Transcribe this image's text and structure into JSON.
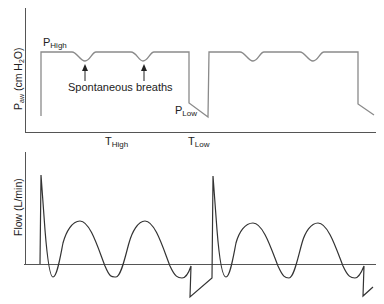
{
  "pressure_panel": {
    "ylabel_main": "P",
    "ylabel_sub": "aw",
    "ylabel_unit_prefix": " (cm H",
    "ylabel_unit_sub": "2",
    "ylabel_unit_suffix": "O)",
    "p_high_main": "P",
    "p_high_sub": "High",
    "p_low_main": "P",
    "p_low_sub": "Low",
    "annotation": "Spontaneous breaths",
    "t_high_main": "T",
    "t_high_sub": "High",
    "t_low_main": "T",
    "t_low_sub": "Low"
  },
  "flow_panel": {
    "ylabel": "Flow (L/min)"
  },
  "colors": {
    "pressure_trace": "#8a8a8a",
    "flow_trace": "#333333",
    "axis": "#555555",
    "text": "#222222"
  }
}
